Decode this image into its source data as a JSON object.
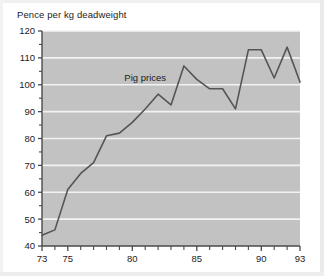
{
  "chart_data": {
    "type": "line",
    "title": "Pence per kg deadweight",
    "xlabel": "",
    "ylabel": "Pence per kg deadweight",
    "grid": true,
    "legend_position": "inline-annotation",
    "annotations": [
      {
        "text": "Pig prices",
        "x": 81.0,
        "y": 101.5
      }
    ],
    "xlim": [
      73,
      93
    ],
    "ylim": [
      40,
      120
    ],
    "ytick_labels": [
      "120",
      "110",
      "100",
      "90",
      "80",
      "70",
      "60",
      "50",
      "40"
    ],
    "yticks": [
      120,
      110,
      100,
      90,
      80,
      70,
      60,
      50,
      40
    ],
    "xtick_labels": [
      "73",
      "75",
      "80",
      "85",
      "90",
      "93"
    ],
    "xticks": [
      73,
      75,
      80,
      85,
      90,
      93
    ],
    "xticks_minor": [
      74,
      76,
      77,
      78,
      79,
      81,
      82,
      83,
      84,
      86,
      87,
      88,
      89,
      91,
      92
    ],
    "series": [
      {
        "name": "Pig prices",
        "color": "#555555",
        "x": [
          73,
          74,
          75,
          76,
          77,
          78,
          79,
          80,
          81,
          82,
          83,
          84,
          85,
          86,
          87,
          88,
          89,
          90,
          91,
          92,
          93
        ],
        "values": [
          44,
          46,
          61,
          67,
          71,
          81,
          82,
          86,
          91,
          96.5,
          92.5,
          107,
          102,
          98.5,
          98.5,
          91,
          113,
          113,
          102.5,
          114,
          101
        ]
      }
    ]
  },
  "colors": {
    "plot_background": "#c2c2c2",
    "gridline": "#f2f2f2",
    "axis": "#4a4a4a",
    "series": "#555555",
    "page_background": "#ffffff",
    "text": "#1b1b1b"
  }
}
